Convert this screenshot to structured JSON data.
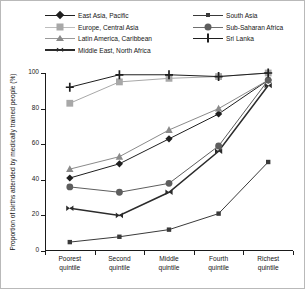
{
  "chart_data": {
    "type": "line",
    "title": "",
    "xlabel": "",
    "ylabel": "Proportion of births attended by medically trained people (%)",
    "ylim": [
      0,
      100
    ],
    "yticks": [
      0,
      20,
      40,
      60,
      80,
      100
    ],
    "ytick_labels": [
      "0",
      "20",
      "40",
      "60",
      "80",
      "100"
    ],
    "grid": false,
    "legend_position": "top",
    "categories": [
      "Poorest quintile",
      "Second quintile",
      "Middle quintile",
      "Fourth quintile",
      "Richest quintile"
    ],
    "category_lines": [
      [
        "Poorest",
        "quintile"
      ],
      [
        "Second",
        "quintile"
      ],
      [
        "Middle",
        "quintile"
      ],
      [
        "Fourth",
        "quintile"
      ],
      [
        "Richest",
        "quintile"
      ]
    ],
    "series": [
      {
        "name": "East Asia, Pacific",
        "marker": "diamond",
        "color": "#1f1f1f",
        "values": [
          41,
          49,
          63,
          77,
          96
        ]
      },
      {
        "name": "Europe, Central Asia",
        "marker": "square",
        "color": "#a8a8a8",
        "values": [
          83,
          95,
          97,
          98,
          100
        ]
      },
      {
        "name": "Latin America, Caribbean",
        "marker": "triangle",
        "color": "#8a8a8a",
        "values": [
          46,
          53,
          68,
          80,
          96
        ]
      },
      {
        "name": "Middle East, North Africa",
        "marker": "bowtie",
        "color": "#2b2b2b",
        "values": [
          24,
          20,
          33,
          56,
          93
        ]
      },
      {
        "name": "South Asia",
        "marker": "small-square",
        "color": "#3a3a3a",
        "values": [
          5,
          8,
          12,
          21,
          50
        ]
      },
      {
        "name": "Sub-Saharan Africa",
        "marker": "circle",
        "color": "#5e5e5e",
        "values": [
          36,
          33,
          38,
          59,
          96
        ]
      },
      {
        "name": "Sri Lanka",
        "marker": "plus",
        "color": "#1f1f1f",
        "values": [
          92,
          99,
          99,
          98,
          100
        ]
      }
    ]
  }
}
